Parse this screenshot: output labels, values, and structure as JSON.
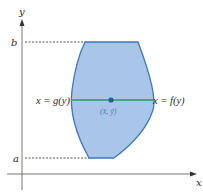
{
  "diagram": {
    "axes": {
      "x_label": "x",
      "y_label": "y"
    },
    "y_ticks": [
      {
        "label": "b",
        "position": "upper bound"
      },
      {
        "label": "a",
        "position": "lower bound"
      }
    ],
    "region": {
      "left_boundary_label": "x = g(y)",
      "right_boundary_label": "x = f(y)",
      "centroid_label": "(x̄, ȳ)"
    },
    "colors": {
      "region_fill": "#a9c6e8",
      "region_stroke": "#3d78bf",
      "horizontal_strip": "#2a9a6a",
      "centroid_dot": "#1f5f99",
      "axes": "#666666",
      "dashed": "#555555"
    }
  }
}
